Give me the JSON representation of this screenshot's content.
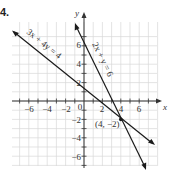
{
  "figure": {
    "label": "4."
  },
  "chart_data": {
    "type": "line",
    "title": "",
    "xlabel": "x",
    "ylabel": "y",
    "xlim": [
      -8,
      8
    ],
    "ylim": [
      -8,
      8
    ],
    "grid": true,
    "x_ticks": [
      -6,
      -4,
      -2,
      0,
      2,
      4,
      6
    ],
    "y_ticks": [
      -6,
      -4,
      -2,
      2,
      4,
      6
    ],
    "x_tick_labels": [
      "−6",
      "−4",
      "−2",
      "0",
      "2",
      "4",
      "6"
    ],
    "y_tick_labels": [
      "−2",
      "−4",
      "−6",
      "2",
      "4",
      "6"
    ],
    "series": [
      {
        "name": "3x + 4y = 4",
        "label": "3x + 4y = 4",
        "slope": -0.75,
        "intercept": 1,
        "x_range": [
          -7.8,
          7.8
        ]
      },
      {
        "name": "2x + y = 6",
        "label": "2x + y = 6",
        "slope": -2,
        "intercept": 6,
        "x_range": [
          -0.6,
          6.8
        ]
      }
    ],
    "annotations": [
      {
        "text": "(4, −2)",
        "x": 4,
        "y": -2,
        "type": "intersection-point"
      }
    ]
  },
  "labels": {
    "x_axis": "x",
    "y_axis": "y",
    "eq1": "3x + 4y = 4",
    "eq2": "2x + y = 6",
    "point": "(4, −2)",
    "xt": [
      "−6",
      "−4",
      "−2",
      "0",
      "2",
      "4",
      "6"
    ],
    "yt_pos": [
      "2",
      "4",
      "6"
    ],
    "yt_neg": [
      "−2",
      "−4",
      "−6"
    ]
  },
  "colors": {
    "grid": "#d9d9d9",
    "axis": "#333333",
    "line": "#1a1a1a"
  }
}
